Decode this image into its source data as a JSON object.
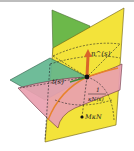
{
  "diagram": {
    "labels": {
      "normal_vector": "n^(s)",
      "tangent_vector": "t(s)",
      "radius_numerator": "1",
      "radius_denominator": "κN(s)",
      "center_point": "MκN"
    },
    "elements": [
      {
        "name": "normal-plane",
        "color": "#f3e33a"
      },
      {
        "name": "rectifying-plane",
        "color": "#6cb84a"
      },
      {
        "name": "tangent-plane",
        "color": "#5fb58e"
      },
      {
        "name": "surface",
        "color": "#e9a0b0"
      },
      {
        "name": "normal-vector-arrow",
        "color": "#d9652a"
      },
      {
        "name": "curve",
        "color": "#e8822a"
      }
    ]
  }
}
